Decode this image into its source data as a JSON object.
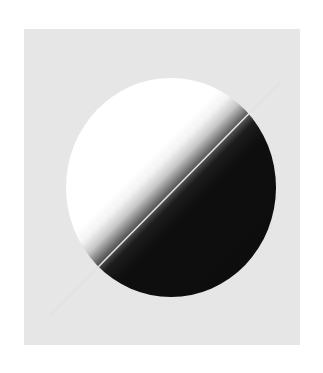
{
  "artwork": {
    "description": "Circle split diagonally into a white-to-black gradient, crossed by a thin light diagonal line on a light gray square",
    "colors": {
      "page_background": "#ffffff",
      "panel_background": "#e6e6e6",
      "light_half": "#ffffff",
      "dark_half": "#0d0d0d",
      "divider_line": "#e0e0e0"
    },
    "shapes": {
      "panel": {
        "x": 24,
        "y": 29,
        "width": 276,
        "height": 316
      },
      "orb": {
        "cx": 170,
        "cy": 188,
        "width": 210,
        "height": 219
      },
      "divider": {
        "x1": 50,
        "y1": 316,
        "x2": 280,
        "y2": 82
      }
    }
  }
}
